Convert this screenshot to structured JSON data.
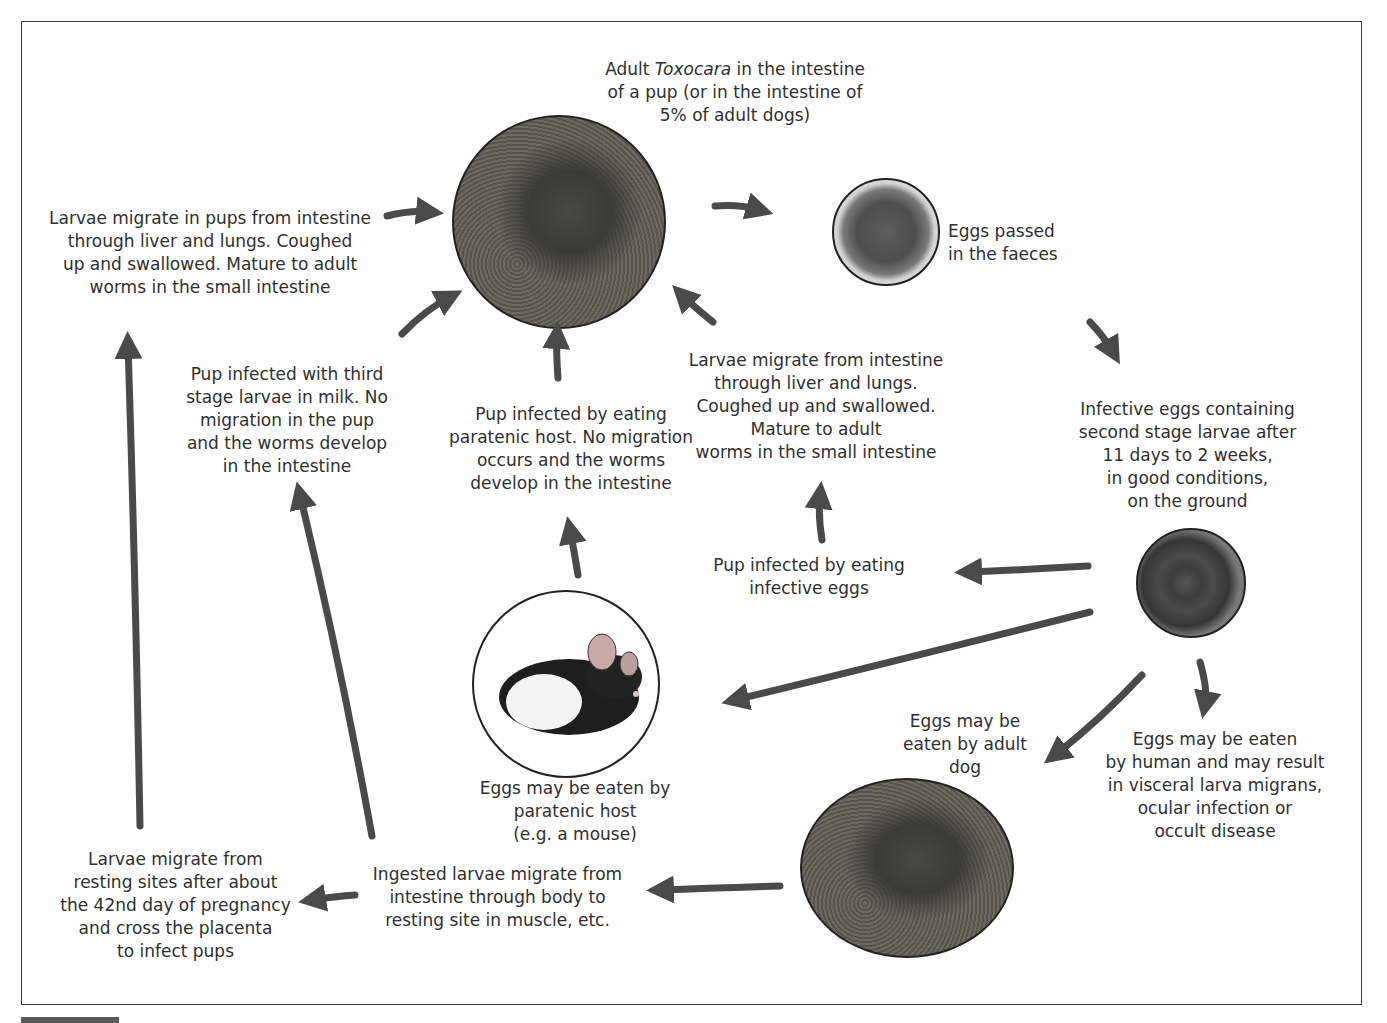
{
  "nodes": {
    "adult": {
      "prefix": "Adult ",
      "genus": "Toxocara",
      "suffix": " in the intestine\nof a pup (or in the intestine of\n5% of adult dogs)",
      "image": "dog-photo"
    },
    "eggs_passed": {
      "text": "Eggs passed\nin the faeces",
      "image": "egg-photo"
    },
    "infective_eggs": {
      "text": "Infective eggs containing\nsecond  stage larvae after\n11 days to 2 weeks,\nin good conditions,\non the ground",
      "image": "larvated-egg-photo"
    },
    "larvae_migrate_right": {
      "text": "Larvae migrate from intestine\nthrough liver and lungs.\nCoughed up and swallowed.\nMature to adult\nworms in the small intestine"
    },
    "pup_eats_eggs": {
      "text": "Pup infected by eating\ninfective eggs"
    },
    "pup_paratenic": {
      "text": "Pup infected by eating\nparatenic host. No migration\noccurs and the worms\ndevelop in the intestine"
    },
    "pup_milk": {
      "text": "Pup infected with third\nstage larvae in milk. No\nmigration in the pup\nand the worms develop\nin the intestine"
    },
    "larvae_migrate_left": {
      "text": "Larvae migrate in pups from intestine\nthrough liver and lungs. Coughed\nup and swallowed. Mature to adult\nworms in the small intestine"
    },
    "paratenic_host": {
      "text": "Eggs may be eaten by\nparatenic host\n(e.g. a mouse)",
      "image": "mouse-photo"
    },
    "adult_dog_eats": {
      "text": "Eggs may be\neaten by adult\ndog",
      "image": "adult-dog-photo"
    },
    "human": {
      "text": "Eggs may be eaten\nby human and may result\nin visceral larva migrans,\nocular infection or\noccult disease"
    },
    "ingested_larvae": {
      "text": "Ingested larvae migrate from\nintestine through body to\nresting site in muscle, etc."
    },
    "placenta": {
      "text": "Larvae migrate from\nresting sites after about\nthe 42nd day of pregnancy\nand cross the placenta\nto infect pups"
    }
  },
  "colors": {
    "arrow": "#4a4a4a",
    "border": "#3a3a3a",
    "text": "#2f2f2f"
  }
}
